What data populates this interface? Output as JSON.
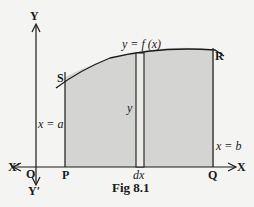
{
  "figure": {
    "caption": "Fig 8.1",
    "curve_label": "y = f (x)",
    "points": {
      "S": "S",
      "R": "R",
      "P": "P",
      "Q": "Q",
      "O": "O"
    },
    "axes": {
      "x": "X",
      "x_neg": "X′",
      "y": "Y",
      "y_neg": "Y′"
    },
    "line_labels": {
      "left": "x = a",
      "right": "x = b",
      "height": "y",
      "strip": "dx"
    },
    "colors": {
      "shade": "#d4d4d2",
      "line": "#1a1a1a",
      "background": "#f4f4f2"
    }
  }
}
